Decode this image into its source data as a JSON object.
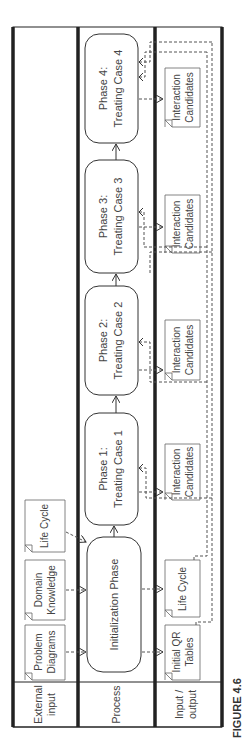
{
  "figure": {
    "caption": "FIGURE 4.6"
  },
  "lanes": [
    {
      "id": "external",
      "label_lines": [
        "External",
        "input"
      ]
    },
    {
      "id": "process",
      "label_lines": [
        "Process"
      ]
    },
    {
      "id": "io",
      "label_lines": [
        "Input /",
        "output"
      ]
    }
  ],
  "process_steps": [
    {
      "id": "init",
      "lines": [
        "Initialization Phase"
      ]
    },
    {
      "id": "p1",
      "lines": [
        "Phase 1:",
        "Treating Case 1"
      ]
    },
    {
      "id": "p2",
      "lines": [
        "Phase 2:",
        "Treating Case 2"
      ]
    },
    {
      "id": "p3",
      "lines": [
        "Phase 3:",
        "Treating Case 3"
      ]
    },
    {
      "id": "p4",
      "lines": [
        "Phase 4:",
        "Treating Case 4"
      ]
    }
  ],
  "external_inputs": [
    {
      "id": "problem-diagrams",
      "lines": [
        "Problem",
        "Diagrams"
      ]
    },
    {
      "id": "domain-knowledge",
      "lines": [
        "Domain",
        "Knowledge"
      ]
    },
    {
      "id": "life-cycle-ext",
      "lines": [
        "Life Cycle"
      ]
    }
  ],
  "io_documents": [
    {
      "id": "initial-qr-tables",
      "lines": [
        "Initial QR",
        "Tables"
      ]
    },
    {
      "id": "life-cycle-io",
      "lines": [
        "Life Cycle"
      ]
    },
    {
      "id": "ic-1",
      "lines": [
        "Interaction",
        "Candidates"
      ]
    },
    {
      "id": "ic-2",
      "lines": [
        "Interaction",
        "Candidates"
      ]
    },
    {
      "id": "ic-3",
      "lines": [
        "Interaction",
        "Candidates"
      ]
    },
    {
      "id": "ic-4",
      "lines": [
        "Interaction",
        "Candidates"
      ]
    }
  ],
  "colors": {
    "line": "#333333",
    "border": "#222222",
    "dashed": "#555555"
  }
}
